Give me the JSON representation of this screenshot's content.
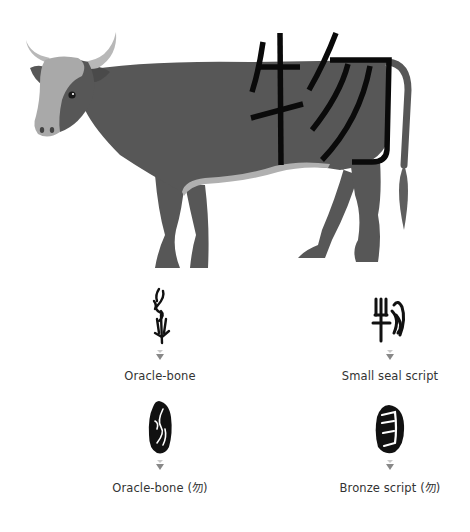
{
  "illustration": {
    "subject": "cow",
    "overlay_character": "物",
    "colors": {
      "body": "#575757",
      "face": "#a9a9a9",
      "horn": "#b8b8b8",
      "belly": "#b0b0b0",
      "tail_tip": "#6a6a6a",
      "stroke": "#0a0a0a"
    }
  },
  "scripts": [
    {
      "id": "oracle-bone",
      "label": "Oracle-bone",
      "glyph": "oracle-bone-glyph"
    },
    {
      "id": "small-seal",
      "label": "Small seal script",
      "glyph": "small-seal-glyph"
    },
    {
      "id": "oracle-bone-wu",
      "label": "Oracle-bone (勿)",
      "glyph": "oracle-bone-wu-glyph"
    },
    {
      "id": "bronze-wu",
      "label": "Bronze script (勿)",
      "glyph": "bronze-wu-glyph"
    }
  ],
  "arrow_color": "#888888"
}
